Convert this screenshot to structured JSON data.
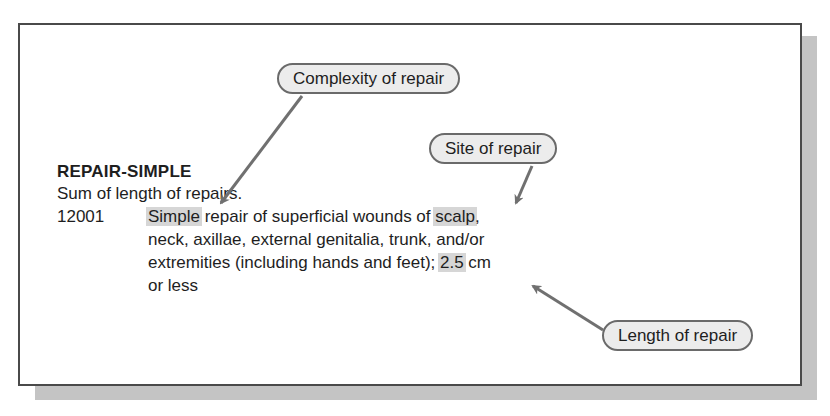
{
  "section": {
    "heading": "REPAIR-SIMPLE",
    "subheading": "Sum of length of repairs."
  },
  "entry": {
    "code": "12001",
    "lines": [
      {
        "pre": "",
        "highlight": "Simple",
        "post": " repair of superficial wounds of "
      },
      {
        "text": "neck, axillae, external genitalia, trunk, and/or"
      },
      {
        "pre": "extremities (including hands and feet); ",
        "highlight": "2.5",
        "post": " cm"
      },
      {
        "text": "or less"
      }
    ],
    "line1_highlight2": "scalp",
    "line1_tail": ","
  },
  "callouts": [
    {
      "label": "Complexity of repair",
      "target": "Simple"
    },
    {
      "label": "Site of repair",
      "target": "scalp"
    },
    {
      "label": "Length of repair",
      "target": "2.5"
    }
  ],
  "colors": {
    "border": "#4a4a4a",
    "shadow": "#c4c4c4",
    "highlight": "#d6d6d6",
    "pill_fill": "#ececec",
    "arrow": "#707070"
  }
}
